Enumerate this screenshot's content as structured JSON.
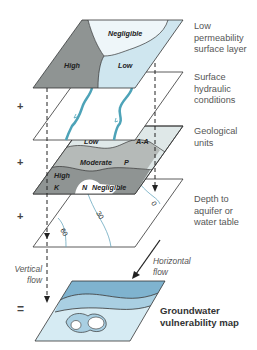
{
  "layers": [
    {
      "id": "surface",
      "label_lines": [
        "Low",
        "permeability",
        "surface layer"
      ],
      "zones": [
        "Negligible",
        "High",
        "Low"
      ]
    },
    {
      "id": "hydraulic",
      "label_lines": [
        "Surface",
        "hydraulic",
        "conditions"
      ]
    },
    {
      "id": "geological",
      "label_lines": [
        "Geological",
        "units"
      ],
      "zones": [
        "Low",
        "A-A",
        "Moderate",
        "P",
        "High",
        "K",
        "N",
        "Negligible"
      ]
    },
    {
      "id": "depth",
      "label_lines": [
        "Depth to",
        "aquifer or",
        "water table"
      ],
      "contours": [
        "0",
        "30",
        "60"
      ]
    }
  ],
  "operators": {
    "plus": "+",
    "equals": "="
  },
  "flows": {
    "vertical": [
      "Vertical",
      "flow"
    ],
    "horizontal": [
      "Horizontal",
      "flow"
    ]
  },
  "result": {
    "label_lines": [
      "Groundwater",
      "vulnerability map"
    ]
  },
  "colors": {
    "high": "#8f9493",
    "moderate": "#b5bab8",
    "low_surface": "#cfe6ef",
    "negligible": "#eef6f9",
    "geo_low": "#dce6e6",
    "river": "#4da3b8",
    "contour": "#6aa8bf",
    "vuln_dark": "#7fb3cf",
    "vuln_mid": "#a9cfe2",
    "vuln_light": "#d6ebf3"
  }
}
